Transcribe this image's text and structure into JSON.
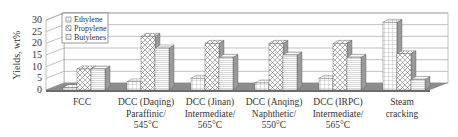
{
  "chart_data": {
    "type": "bar",
    "style": "3d-clustered",
    "title": "",
    "xlabel": "",
    "ylabel": "Yields, wt%",
    "ylim": [
      0,
      30
    ],
    "yticks": [
      0,
      5,
      10,
      15,
      20,
      25,
      30
    ],
    "grid": true,
    "legend_position": "top-left-inside",
    "categories": [
      [
        "FCC"
      ],
      [
        "DCC (Daqing)",
        "Paraffinic/",
        "545°C"
      ],
      [
        "DCC (Jinan)",
        "Intermediate/",
        "565°C"
      ],
      [
        "DCC (Anqing)",
        "Naphthetic/",
        "550°C"
      ],
      [
        "DCC (IRPC)",
        "Intermediate/",
        "565°C"
      ],
      [
        "Steam",
        "cracking"
      ]
    ],
    "series": [
      {
        "name": "Ethylene",
        "pattern": "grid",
        "values": [
          1.0,
          3.5,
          5.0,
          3.0,
          5.0,
          29.0
        ]
      },
      {
        "name": "Propylene",
        "pattern": "cross",
        "values": [
          9.0,
          23.0,
          20.0,
          20.0,
          20.0,
          15.5
        ]
      },
      {
        "name": "Butylenes",
        "pattern": "hline",
        "values": [
          9.0,
          18.0,
          14.0,
          15.0,
          14.0,
          4.5
        ]
      }
    ]
  },
  "legend": {
    "items": [
      "Ethylene",
      "Propylene",
      "Butylenes"
    ]
  },
  "axis": {
    "ylabel": "Yields, wt%"
  },
  "colors": {
    "floor": "#8c8c8c",
    "side": "#9a9a9a",
    "top": "#b5b5b5",
    "gridline": "#999999",
    "text": "#333333"
  }
}
